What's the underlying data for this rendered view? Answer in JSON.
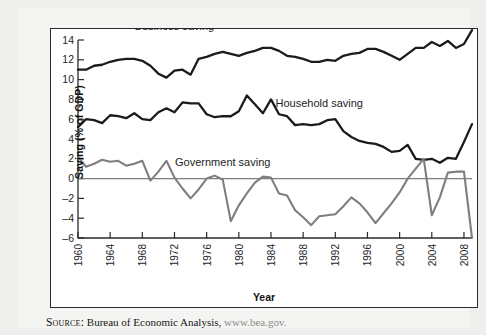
{
  "figure": {
    "source_label": "Source:",
    "source_text": " Bureau of Economic Analysis, ",
    "source_url": "www.bea.gov."
  },
  "chart_data": {
    "type": "line",
    "title": "",
    "xlabel": "Year",
    "ylabel": "Saving (% of GDP)",
    "xlim": [
      1960,
      2009
    ],
    "ylim": [
      -6,
      14
    ],
    "yticks": [
      -6,
      -4,
      -2,
      0,
      2,
      4,
      6,
      8,
      10,
      12,
      14
    ],
    "xticks": [
      1960,
      1964,
      1968,
      1972,
      1976,
      1980,
      1984,
      1988,
      1992,
      1996,
      2000,
      2004,
      2008
    ],
    "grid": false,
    "zero_line": true,
    "legend_position": "inline-annotations",
    "x": [
      1960,
      1961,
      1962,
      1963,
      1964,
      1965,
      1966,
      1967,
      1968,
      1969,
      1970,
      1971,
      1972,
      1973,
      1974,
      1975,
      1976,
      1977,
      1978,
      1979,
      1980,
      1981,
      1982,
      1983,
      1984,
      1985,
      1986,
      1987,
      1988,
      1989,
      1990,
      1991,
      1992,
      1993,
      1994,
      1995,
      1996,
      1997,
      1998,
      1999,
      2000,
      2001,
      2002,
      2003,
      2004,
      2005,
      2006,
      2007,
      2008,
      2009
    ],
    "series": [
      {
        "name": "Business saving",
        "color": "#1b1b1b",
        "label_x": 1972,
        "label_y": 15.0,
        "values": [
          11.0,
          11.0,
          11.4,
          11.5,
          11.8,
          12.0,
          12.1,
          12.1,
          11.9,
          11.4,
          10.6,
          10.2,
          10.9,
          11.0,
          10.5,
          12.1,
          12.3,
          12.6,
          12.8,
          12.6,
          12.4,
          12.7,
          12.9,
          13.2,
          13.2,
          12.9,
          12.4,
          12.3,
          12.1,
          11.8,
          11.8,
          12.0,
          11.9,
          12.4,
          12.6,
          12.7,
          13.1,
          13.1,
          12.8,
          12.4,
          12.0,
          12.6,
          13.2,
          13.2,
          13.8,
          13.4,
          13.9,
          13.2,
          13.6,
          15.0
        ]
      },
      {
        "name": "Household saving",
        "color": "#1b1b1b",
        "label_x": 1990,
        "label_y": 7.2,
        "values": [
          5.2,
          6.0,
          5.9,
          5.6,
          6.4,
          6.3,
          6.1,
          6.6,
          6.0,
          5.9,
          6.7,
          7.1,
          6.7,
          7.7,
          7.6,
          7.6,
          6.5,
          6.2,
          6.3,
          6.3,
          6.8,
          8.4,
          7.5,
          6.6,
          8.0,
          6.5,
          6.3,
          5.4,
          5.5,
          5.4,
          5.5,
          5.9,
          6.0,
          4.8,
          4.2,
          3.8,
          3.6,
          3.5,
          3.2,
          2.7,
          2.8,
          3.4,
          2.0,
          1.9,
          2.0,
          1.6,
          2.1,
          2.0,
          3.7,
          5.5
        ]
      },
      {
        "name": "Government saving",
        "color": "#7e7e7e",
        "label_x": 1978,
        "label_y": 1.3,
        "values": [
          2.2,
          1.2,
          1.5,
          1.9,
          1.7,
          1.8,
          1.3,
          1.5,
          1.8,
          -0.2,
          0.7,
          1.8,
          0.1,
          -1.0,
          -2.0,
          -1.1,
          0.0,
          0.3,
          -0.1,
          -4.3,
          -2.7,
          -1.5,
          -0.4,
          0.2,
          0.1,
          -1.5,
          -1.7,
          -3.2,
          -3.9,
          -4.7,
          -3.8,
          -3.7,
          -3.6,
          -2.8,
          -1.9,
          -2.5,
          -3.4,
          -4.5,
          -3.5,
          -2.5,
          -1.4,
          0.0,
          1.0,
          2.0,
          2.5,
          1.6,
          1.9,
          -0.5,
          -2.5,
          -3.7
        ]
      }
    ],
    "government_tail": {
      "note": "government series continues to sharp trough at right edge",
      "x": [
        2004,
        2005,
        2006,
        2007,
        2008,
        2009
      ],
      "values": [
        -3.7,
        -1.9,
        0.6,
        0.7,
        0.7,
        -6.0
      ]
    }
  }
}
